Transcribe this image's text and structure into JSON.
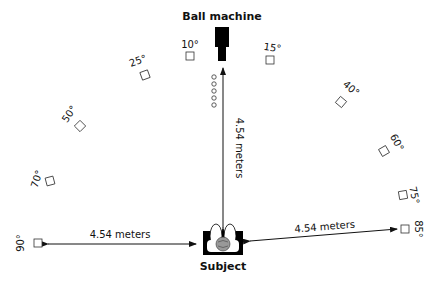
{
  "title": "Ball machine",
  "subject_label": "Subject",
  "distances": {
    "vertical": "4.54 meters",
    "left": "4.54 meters",
    "right": "4.54 meters"
  },
  "angles": [
    {
      "label": "10°",
      "side": "left"
    },
    {
      "label": "15°",
      "side": "right"
    },
    {
      "label": "25°",
      "side": "left"
    },
    {
      "label": "40°",
      "side": "right"
    },
    {
      "label": "50°",
      "side": "left"
    },
    {
      "label": "60°",
      "side": "right"
    },
    {
      "label": "70°",
      "side": "left"
    },
    {
      "label": "75°",
      "side": "right"
    },
    {
      "label": "90°",
      "side": "left"
    },
    {
      "label": "85°",
      "side": "right"
    }
  ],
  "ball_count": 5
}
